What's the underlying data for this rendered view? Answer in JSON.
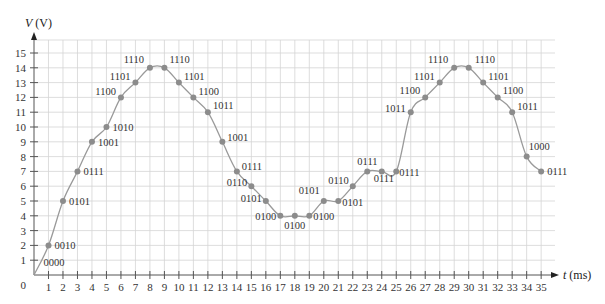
{
  "chart_data": {
    "type": "line",
    "title": "",
    "xlabel": "t (ms)",
    "ylabel": "V (V)",
    "xlabel_var": "t",
    "xlabel_unit": "(ms)",
    "ylabel_var": "V",
    "ylabel_unit": "(V)",
    "xlim": [
      0,
      35
    ],
    "ylim": [
      0,
      15
    ],
    "grid": true,
    "legend": null,
    "x_ticks": [
      1,
      2,
      3,
      4,
      5,
      6,
      7,
      8,
      9,
      10,
      11,
      12,
      13,
      14,
      15,
      16,
      17,
      18,
      19,
      20,
      21,
      22,
      23,
      24,
      25,
      26,
      27,
      28,
      29,
      30,
      31,
      32,
      33,
      34,
      35
    ],
    "y_ticks": [
      1,
      2,
      3,
      4,
      5,
      6,
      7,
      8,
      9,
      10,
      11,
      12,
      13,
      14,
      15
    ],
    "origin_label": "0",
    "series": [
      {
        "name": "Sampled voltage",
        "x": [
          0,
          1,
          2,
          3,
          4,
          5,
          6,
          7,
          8,
          9,
          10,
          11,
          12,
          13,
          14,
          15,
          16,
          17,
          18,
          19,
          20,
          21,
          22,
          23,
          24,
          25,
          26,
          27,
          28,
          29,
          30,
          31,
          32,
          33,
          34,
          35
        ],
        "values": [
          0,
          2,
          5,
          7,
          9,
          10,
          12,
          13,
          14,
          14,
          13,
          12,
          11,
          9,
          7,
          6,
          5,
          4,
          4,
          4,
          5,
          5,
          6,
          7,
          7,
          7,
          11,
          12,
          13,
          14,
          14,
          13,
          12,
          11,
          8,
          7
        ],
        "codes": [
          "0000",
          "0010",
          "0101",
          "0111",
          "1001",
          "1010",
          "1100",
          "1101",
          "1110",
          "1110",
          "1101",
          "1100",
          "1011",
          "1001",
          "0111",
          "0110",
          "0101",
          "0100",
          "0100",
          "0100",
          "0101",
          "0101",
          "0110",
          "0111",
          "0111",
          "0111",
          "1011",
          "1100",
          "1101",
          "1110",
          "1110",
          "1101",
          "1100",
          "1011",
          "1000",
          "0111"
        ]
      }
    ],
    "colors": {
      "curve": "#9a9a9a",
      "marker": "#8c8c8c",
      "grid": "#d4d4d4",
      "axis": "#555555",
      "text": "#333333"
    }
  }
}
